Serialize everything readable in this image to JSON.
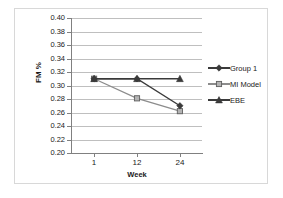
{
  "chart_data": {
    "type": "line",
    "title": "",
    "xlabel": "Week",
    "ylabel": "FM %",
    "x": [
      1,
      12,
      24
    ],
    "categories": [
      "1",
      "12",
      "24"
    ],
    "xtick_labels": [
      "1",
      "12",
      "24"
    ],
    "ytick_labels": [
      "0.40",
      "0.38",
      "0.36",
      "0.34",
      "0.32",
      "0.30",
      "0.28",
      "0.26",
      "0.24",
      "0.22",
      "0.20"
    ],
    "ylim": [
      0.2,
      0.4
    ],
    "ytick_step": 0.02,
    "xlim": [
      0,
      3
    ],
    "grid": "horizontal",
    "legend_position": "right",
    "series": [
      {
        "name": "Group 1",
        "marker": "diamond",
        "color": "#3a3a3a",
        "values": [
          0.31,
          0.31,
          0.27
        ]
      },
      {
        "name": "MI Model",
        "marker": "square",
        "color": "#8c8c8c",
        "values": [
          0.31,
          0.281,
          0.262
        ]
      },
      {
        "name": "EBE",
        "marker": "triangle",
        "color": "#3a3a3a",
        "values": [
          0.31,
          0.31,
          0.31
        ]
      }
    ]
  },
  "legend": {
    "entries": [
      {
        "label": "Group 1"
      },
      {
        "label": "MI Model"
      },
      {
        "label": "EBE"
      }
    ]
  },
  "axes": {
    "y_label": "FM %",
    "x_label": "Week",
    "y_ticks": [
      "0.40",
      "0.38",
      "0.36",
      "0.34",
      "0.32",
      "0.30",
      "0.28",
      "0.26",
      "0.24",
      "0.22",
      "0.20"
    ],
    "x_ticks": [
      "1",
      "12",
      "24"
    ]
  },
  "colors": {
    "grid": "#bfbfbf",
    "axis": "#808080",
    "frame": "#d8d8d8",
    "dark_series": "#3a3a3a",
    "light_series": "#8c8c8c",
    "background": "#ffffff"
  }
}
